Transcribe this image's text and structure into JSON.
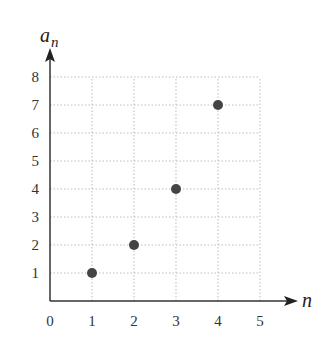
{
  "chart_data": {
    "type": "scatter",
    "title": "",
    "xlabel": "n",
    "ylabel": "a_n",
    "ylabel_main": "a",
    "ylabel_sub": "n",
    "xlim": [
      0,
      5
    ],
    "ylim": [
      0,
      8
    ],
    "grid": true,
    "x_ticks": [
      "0",
      "1",
      "2",
      "3",
      "4",
      "5"
    ],
    "y_ticks": [
      "1",
      "2",
      "3",
      "4",
      "5",
      "6",
      "7",
      "8"
    ],
    "points": [
      {
        "x": 1,
        "y": 1
      },
      {
        "x": 2,
        "y": 2
      },
      {
        "x": 3,
        "y": 4
      },
      {
        "x": 4,
        "y": 7
      }
    ],
    "point_color": "#444444",
    "grid_color": "#bbbbbb",
    "axis_color": "#333333"
  }
}
